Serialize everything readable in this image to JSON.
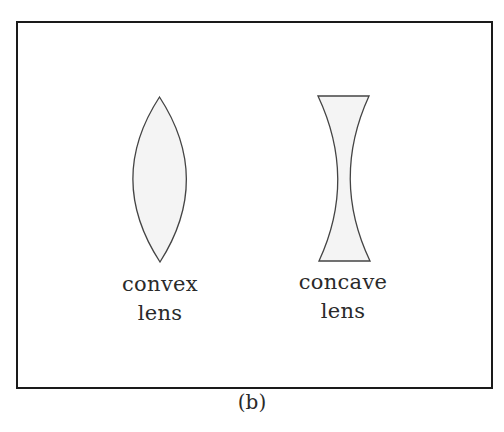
{
  "figure": {
    "caption": "(b)",
    "colors": {
      "border": "#1a1a1a",
      "lens_stroke": "#444444",
      "lens_fill": "#f4f4f4",
      "text": "#2a2a2a"
    },
    "lenses": [
      {
        "type": "convex",
        "label_line1": "convex",
        "label_line2": "lens"
      },
      {
        "type": "concave",
        "label_line1": "concave",
        "label_line2": "lens"
      }
    ]
  }
}
